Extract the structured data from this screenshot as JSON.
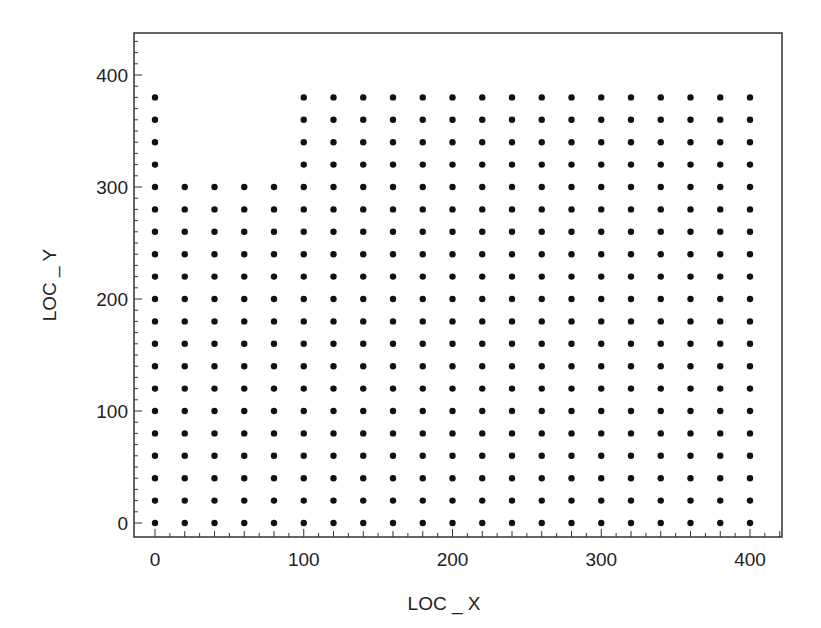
{
  "chart_data": {
    "type": "scatter",
    "title": "",
    "xlabel": "LOC _ X",
    "ylabel": "LOC _ Y",
    "xlim": [
      -15,
      425
    ],
    "ylim": [
      -15,
      440
    ],
    "xticks": [
      0,
      100,
      200,
      300,
      400
    ],
    "yticks": [
      0,
      100,
      200,
      300,
      400
    ],
    "x_minor_step": 10,
    "y_minor_step": 10,
    "grid": false,
    "legend": null,
    "marker_color": "#111111",
    "grid_spacing": 20,
    "columns": [
      {
        "x": 0,
        "y_min": 0,
        "y_max": 380
      },
      {
        "x": 20,
        "y_min": 0,
        "y_max": 300
      },
      {
        "x": 40,
        "y_min": 0,
        "y_max": 300
      },
      {
        "x": 60,
        "y_min": 0,
        "y_max": 300
      },
      {
        "x": 80,
        "y_min": 0,
        "y_max": 300
      },
      {
        "x": 100,
        "y_min": 0,
        "y_max": 380
      },
      {
        "x": 120,
        "y_min": 0,
        "y_max": 380
      },
      {
        "x": 140,
        "y_min": 0,
        "y_max": 380
      },
      {
        "x": 160,
        "y_min": 0,
        "y_max": 380
      },
      {
        "x": 180,
        "y_min": 0,
        "y_max": 380
      },
      {
        "x": 200,
        "y_min": 0,
        "y_max": 380
      },
      {
        "x": 220,
        "y_min": 0,
        "y_max": 380
      },
      {
        "x": 240,
        "y_min": 0,
        "y_max": 380
      },
      {
        "x": 260,
        "y_min": 0,
        "y_max": 380
      },
      {
        "x": 280,
        "y_min": 0,
        "y_max": 380
      },
      {
        "x": 300,
        "y_min": 0,
        "y_max": 380
      },
      {
        "x": 320,
        "y_min": 0,
        "y_max": 380
      },
      {
        "x": 340,
        "y_min": 0,
        "y_max": 380
      },
      {
        "x": 360,
        "y_min": 0,
        "y_max": 380
      },
      {
        "x": 380,
        "y_min": 0,
        "y_max": 380
      },
      {
        "x": 400,
        "y_min": 0,
        "y_max": 380
      }
    ]
  }
}
